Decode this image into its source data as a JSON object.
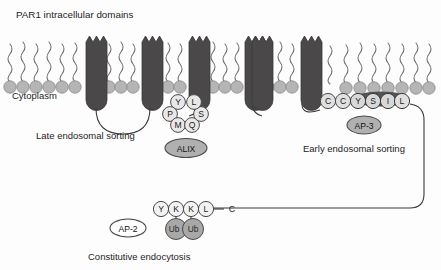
{
  "figure": {
    "title": "PAR1 intracellular domains",
    "cytoplasm_label": "Cytoplasm",
    "width": 441,
    "height": 270
  },
  "colors": {
    "helix_fill": "#4a4849",
    "lipid_head": "#b3b3b3",
    "lipid_tail": "#6b6b6b",
    "residue_light": "#e3e3e3",
    "residue_dark": "#4a4849",
    "adaptor_gray": "#b0b0b0",
    "adaptor_white": "#ffffff",
    "ubiquitin": "#a8a8a8",
    "line": "#3a3a3a",
    "text": "#1d1d1d"
  },
  "membrane": {
    "lipid_heads_count": 26,
    "helix_count": 7,
    "gap_note": "membrane gap after helix 7"
  },
  "captions": [
    {
      "id": "late-endosomal-sorting",
      "text": "Late endosomal sorting",
      "x": 36,
      "y": 136
    },
    {
      "id": "early-endosomal-sorting",
      "text": "Early endosomal sorting",
      "x": 303,
      "y": 150
    },
    {
      "id": "constitutive-endocytosis",
      "text": "Constitutive endocytosis",
      "x": 88,
      "y": 258
    }
  ],
  "motifs": {
    "alix": {
      "name": "ALIX",
      "adaptor_label": "ALIX",
      "adaptor_style": "gray",
      "residues": [
        {
          "letter": "Y",
          "x": 178,
          "y": 102,
          "shade": "light"
        },
        {
          "letter": "P",
          "x": 170,
          "y": 114,
          "shade": "light"
        },
        {
          "letter": "M",
          "x": 178,
          "y": 124,
          "shade": "light"
        },
        {
          "letter": "Q",
          "x": 192,
          "y": 124,
          "shade": "light"
        },
        {
          "letter": "S",
          "x": 201,
          "y": 114,
          "shade": "light"
        },
        {
          "letter": "L",
          "x": 194,
          "y": 102,
          "shade": "light"
        }
      ],
      "sequence": "YPMQSL"
    },
    "ap3": {
      "name": "AP-3",
      "adaptor_label": "AP-3",
      "adaptor_style": "gray",
      "residues": [
        {
          "letter": "C",
          "x": 328,
          "y": 101,
          "shade": "light"
        },
        {
          "letter": "C",
          "x": 343,
          "y": 101,
          "shade": "light"
        },
        {
          "letter": "Y",
          "x": 358,
          "y": 101,
          "shade": "dark"
        },
        {
          "letter": "S",
          "x": 373,
          "y": 101,
          "shade": "dark"
        },
        {
          "letter": "I",
          "x": 388,
          "y": 101,
          "shade": "dark"
        },
        {
          "letter": "L",
          "x": 402,
          "y": 101,
          "shade": "dark"
        }
      ],
      "sequence": "CCYSIL"
    },
    "ap2": {
      "name": "AP-2",
      "adaptor_label": "AP-2",
      "adaptor_style": "white",
      "residues": [
        {
          "letter": "Y",
          "x": 161,
          "y": 209,
          "shade": "light"
        },
        {
          "letter": "K",
          "x": 176,
          "y": 209,
          "shade": "light"
        },
        {
          "letter": "K",
          "x": 191,
          "y": 209,
          "shade": "light"
        },
        {
          "letter": "L",
          "x": 206,
          "y": 209,
          "shade": "light"
        }
      ],
      "sequence": "YKKL",
      "terminus_label": "C",
      "ubiquitins": [
        {
          "label": "Ub",
          "x": 176,
          "y": 228
        },
        {
          "label": "Ub",
          "x": 192,
          "y": 228
        }
      ]
    }
  }
}
